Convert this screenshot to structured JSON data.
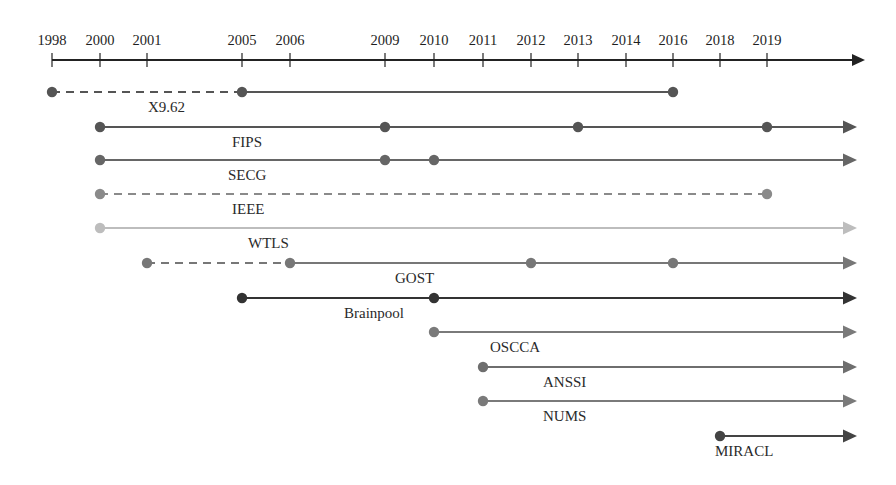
{
  "axis": {
    "years": [
      "1998",
      "2000",
      "2001",
      "2005",
      "2006",
      "2009",
      "2010",
      "2011",
      "2012",
      "2013",
      "2014",
      "2016",
      "2018",
      "2019"
    ],
    "y": 60,
    "x_start": 52,
    "x_end": 865,
    "color": "#222222"
  },
  "rows": [
    {
      "label": "X9.62",
      "y": 92,
      "label_x": 148,
      "color": "#555555",
      "segments": [
        {
          "from": "1998",
          "to": "2005",
          "style": "dashed"
        },
        {
          "from": "2005",
          "to": "2016",
          "style": "solid"
        }
      ],
      "dots": [
        "1998",
        "2005",
        "2016"
      ],
      "arrow": false
    },
    {
      "label": "FIPS",
      "y": 127,
      "label_x": 232,
      "color": "#555555",
      "segments": [
        {
          "from": "2000",
          "to": "end",
          "style": "solid"
        }
      ],
      "dots": [
        "2000",
        "2009",
        "2013",
        "2019"
      ],
      "arrow": true
    },
    {
      "label": "SECG",
      "y": 160,
      "label_x": 228,
      "color": "#666666",
      "segments": [
        {
          "from": "2000",
          "to": "end",
          "style": "solid"
        }
      ],
      "dots": [
        "2000",
        "2009",
        "2010"
      ],
      "arrow": true
    },
    {
      "label": "IEEE",
      "y": 194,
      "label_x": 232,
      "color": "#8a8a8a",
      "segments": [
        {
          "from": "2000",
          "to": "2019",
          "style": "dashed"
        }
      ],
      "dots": [
        "2000",
        "2019"
      ],
      "arrow": false
    },
    {
      "label": "WTLS",
      "y": 228,
      "label_x": 248,
      "color": "#bdbdbd",
      "segments": [
        {
          "from": "2000",
          "to": "end",
          "style": "solid"
        }
      ],
      "dots": [
        "2000"
      ],
      "arrow": true
    },
    {
      "label": "GOST",
      "y": 263,
      "label_x": 395,
      "color": "#777777",
      "segments": [
        {
          "from": "2001",
          "to": "2006",
          "style": "dashed"
        },
        {
          "from": "2006",
          "to": "end",
          "style": "solid"
        }
      ],
      "dots": [
        "2001",
        "2006",
        "2012",
        "2016"
      ],
      "arrow": true
    },
    {
      "label": "Brainpool",
      "y": 298,
      "label_x": 344,
      "color": "#333333",
      "segments": [
        {
          "from": "2005",
          "to": "end",
          "style": "solid"
        }
      ],
      "dots": [
        "2005",
        "2010"
      ],
      "arrow": true
    },
    {
      "label": "OSCCA",
      "y": 332,
      "label_x": 490,
      "color": "#7a7a7a",
      "segments": [
        {
          "from": "2010",
          "to": "end",
          "style": "solid"
        }
      ],
      "dots": [
        "2010"
      ],
      "arrow": true
    },
    {
      "label": "ANSSI",
      "y": 367,
      "label_x": 543,
      "color": "#6e6e6e",
      "segments": [
        {
          "from": "2011",
          "to": "end",
          "style": "solid"
        }
      ],
      "dots": [
        "2011"
      ],
      "arrow": true
    },
    {
      "label": "NUMS",
      "y": 401,
      "label_x": 543,
      "color": "#7a7a7a",
      "segments": [
        {
          "from": "2011",
          "to": "end",
          "style": "solid"
        }
      ],
      "dots": [
        "2011"
      ],
      "arrow": true
    },
    {
      "label": "MIRACL",
      "y": 436,
      "label_x": 715,
      "color": "#444444",
      "segments": [
        {
          "from": "2018",
          "to": "end",
          "style": "solid"
        }
      ],
      "dots": [
        "2018"
      ],
      "arrow": true
    }
  ],
  "chart_data": {
    "type": "timeline",
    "title": "",
    "x_ticks": [
      "1998",
      "2000",
      "2001",
      "2005",
      "2006",
      "2009",
      "2010",
      "2011",
      "2012",
      "2013",
      "2014",
      "2016",
      "2018",
      "2019"
    ],
    "series": [
      {
        "name": "X9.62",
        "events": [
          1998,
          2005,
          2016
        ],
        "dashed_range": [
          1998,
          2005
        ],
        "ongoing": false
      },
      {
        "name": "FIPS",
        "events": [
          2000,
          2009,
          2013,
          2019
        ],
        "ongoing": true
      },
      {
        "name": "SECG",
        "events": [
          2000,
          2009,
          2010
        ],
        "ongoing": true
      },
      {
        "name": "IEEE",
        "events": [
          2000,
          2019
        ],
        "dashed_range": [
          2000,
          2019
        ],
        "ongoing": false
      },
      {
        "name": "WTLS",
        "events": [
          2000
        ],
        "ongoing": true
      },
      {
        "name": "GOST",
        "events": [
          2001,
          2006,
          2012,
          2016
        ],
        "dashed_range": [
          2001,
          2006
        ],
        "ongoing": true
      },
      {
        "name": "Brainpool",
        "events": [
          2005,
          2010
        ],
        "ongoing": true
      },
      {
        "name": "OSCCA",
        "events": [
          2010
        ],
        "ongoing": true
      },
      {
        "name": "ANSSI",
        "events": [
          2011
        ],
        "ongoing": true
      },
      {
        "name": "NUMS",
        "events": [
          2011
        ],
        "ongoing": true
      },
      {
        "name": "MIRACL",
        "events": [
          2018
        ],
        "ongoing": true
      }
    ]
  }
}
